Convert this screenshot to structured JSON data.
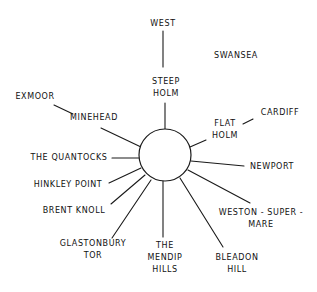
{
  "diagram": {
    "type": "radial-landmark-sketch",
    "stroke_color": "#1a1a1a",
    "background": "#ffffff",
    "center": {
      "x": 165,
      "y": 155,
      "r": 26
    },
    "labels": [
      {
        "id": "west",
        "lines": [
          "WEST"
        ],
        "x": 163,
        "y": 24
      },
      {
        "id": "swansea",
        "lines": [
          "SWANSEA"
        ],
        "x": 236,
        "y": 56
      },
      {
        "id": "steep-holm",
        "lines": [
          "STEEP",
          "HOLM"
        ],
        "x": 166,
        "y": 88
      },
      {
        "id": "exmoor",
        "lines": [
          "EXMOOR"
        ],
        "x": 35,
        "y": 97
      },
      {
        "id": "minehead",
        "lines": [
          "MINEHEAD"
        ],
        "x": 94,
        "y": 118
      },
      {
        "id": "cardiff",
        "lines": [
          "CARDIFF"
        ],
        "x": 280,
        "y": 113
      },
      {
        "id": "flat-holm",
        "lines": [
          "FLAT",
          "HOLM"
        ],
        "x": 225,
        "y": 130
      },
      {
        "id": "the-quantocks",
        "lines": [
          "THE QUANTOCKS"
        ],
        "x": 69,
        "y": 158
      },
      {
        "id": "newport",
        "lines": [
          "NEWPORT"
        ],
        "x": 272,
        "y": 167
      },
      {
        "id": "hinkley-point",
        "lines": [
          "HINKLEY POINT"
        ],
        "x": 68,
        "y": 185
      },
      {
        "id": "brent-knoll",
        "lines": [
          "BRENT KNOLL"
        ],
        "x": 74,
        "y": 211
      },
      {
        "id": "weston-super-mare",
        "lines": [
          "WESTON - SUPER -",
          "MARE"
        ],
        "x": 261,
        "y": 219
      },
      {
        "id": "glastonbury-tor",
        "lines": [
          "GLASTONBURY",
          "TOR"
        ],
        "x": 93,
        "y": 250
      },
      {
        "id": "the-mendip-hills",
        "lines": [
          "THE",
          "MENDIP",
          "HILLS"
        ],
        "x": 165,
        "y": 258
      },
      {
        "id": "bleadon-hill",
        "lines": [
          "BLEADON",
          "HILL"
        ],
        "x": 237,
        "y": 264
      }
    ],
    "connectors": [
      {
        "id": "west-to-steep-holm",
        "x1": 163,
        "y1": 31,
        "x2": 163,
        "y2": 67
      },
      {
        "id": "steep-holm-to-center",
        "x1": 165,
        "y1": 103,
        "x2": 165,
        "y2": 129
      },
      {
        "id": "exmoor-to-minehead",
        "x1": 54,
        "y1": 105,
        "x2": 73,
        "y2": 114
      },
      {
        "id": "minehead-to-center",
        "x1": 101,
        "y1": 128,
        "x2": 141,
        "y2": 147
      },
      {
        "id": "cardiff-to-flat-holm",
        "x1": 243,
        "y1": 124,
        "x2": 253,
        "y2": 119
      },
      {
        "id": "flat-holm-to-center",
        "x1": 190,
        "y1": 147,
        "x2": 206,
        "y2": 140
      },
      {
        "id": "quantocks-to-center",
        "x1": 112,
        "y1": 158,
        "x2": 139,
        "y2": 158
      },
      {
        "id": "newport-to-center",
        "x1": 191,
        "y1": 161,
        "x2": 244,
        "y2": 166
      },
      {
        "id": "hinkley-point-to-center",
        "x1": 109,
        "y1": 183,
        "x2": 141,
        "y2": 168
      },
      {
        "id": "brent-knoll-to-center",
        "x1": 111,
        "y1": 204,
        "x2": 145,
        "y2": 175
      },
      {
        "id": "glastonbury-tor-to-center",
        "x1": 112,
        "y1": 238,
        "x2": 151,
        "y2": 180
      },
      {
        "id": "mendip-hills-to-center",
        "x1": 163,
        "y1": 181,
        "x2": 163,
        "y2": 237
      },
      {
        "id": "bleadon-hill-to-center",
        "x1": 180,
        "y1": 178,
        "x2": 223,
        "y2": 247
      },
      {
        "id": "weston-super-mare-to-center",
        "x1": 188,
        "y1": 170,
        "x2": 250,
        "y2": 203
      }
    ]
  }
}
